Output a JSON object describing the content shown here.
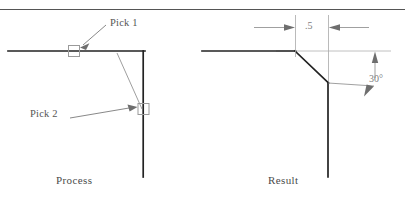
{
  "figure": {
    "panels": [
      {
        "name": "process",
        "caption": "Process",
        "annotations": [
          {
            "id": "pick1",
            "text": "Pick 1",
            "target": "horizontal-line"
          },
          {
            "id": "pick2",
            "text": "Pick 2",
            "target": "vertical-line"
          }
        ]
      },
      {
        "name": "result",
        "caption": "Result",
        "dimensions": [
          {
            "id": "length",
            "text": ".5",
            "kind": "linear"
          },
          {
            "id": "angle",
            "text": "30°",
            "kind": "angular"
          }
        ]
      }
    ]
  },
  "captions": {
    "process": "Process",
    "result": "Result"
  },
  "labels": {
    "pick1": "Pick 1",
    "pick2": "Pick 2"
  },
  "dimensions": {
    "length": ".5",
    "angle": "30°"
  },
  "colors": {
    "object_line": "#222222",
    "construction_line": "#9a9a9a",
    "leader_line": "#7a7a7a",
    "marker_stroke": "#8e8e8e",
    "text": "#4a4a4a",
    "dim_text": "#7d7d7d",
    "rule": "#555555",
    "background": "#ffffff"
  },
  "geometry": {
    "top_rule_y": 9,
    "process": {
      "horizontal_line": {
        "x1": 8,
        "y1": 51,
        "x2": 145,
        "y2": 51
      },
      "vertical_line": {
        "x1": 143,
        "y1": 51,
        "x2": 143,
        "y2": 176
      },
      "preview_chamfer": {
        "x1": 118,
        "y1": 52,
        "x2": 142,
        "y2": 108
      },
      "pick1_marker": {
        "x": 68,
        "y": 46,
        "size": 11
      },
      "pick2_marker": {
        "x": 138,
        "y": 104,
        "size": 11
      }
    },
    "result": {
      "horizontal_line": {
        "x1": 202,
        "y1": 51,
        "x2": 295,
        "y2": 51
      },
      "chamfer_line": {
        "x1": 295,
        "y1": 51,
        "x2": 328,
        "y2": 83
      },
      "vertical_line": {
        "x1": 328,
        "y1": 83,
        "x2": 328,
        "y2": 176
      },
      "ext_line_left": {
        "x": 295,
        "y1": 16,
        "y2": 58
      },
      "ext_line_right": {
        "x": 328,
        "y1": 16,
        "y2": 82
      },
      "construction_horizontal": {
        "x1": 278,
        "y1": 51,
        "x2": 390,
        "y2": 51
      }
    }
  }
}
